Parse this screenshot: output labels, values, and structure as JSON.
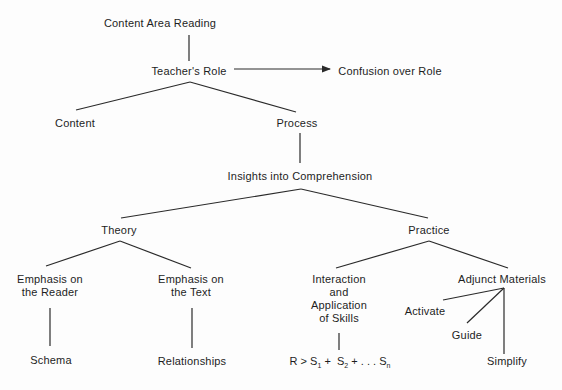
{
  "diagram": {
    "type": "tree",
    "nodes": {
      "root": "Content Area Reading",
      "teachers_role": "Teacher's Role",
      "confusion": "Confusion over Role",
      "content": "Content",
      "process": "Process",
      "insights": "Insights into Comprehension",
      "theory": "Theory",
      "practice": "Practice",
      "emph_reader_1": "Emphasis on",
      "emph_reader_2": "the Reader",
      "emph_text_1": "Emphasis on",
      "emph_text_2": "the Text",
      "interaction_1": "Interaction",
      "interaction_2": "and",
      "interaction_3": "Application",
      "interaction_4": "of Skills",
      "adjunct": "Adjunct Materials",
      "activate": "Activate",
      "guide": "Guide",
      "simplify": "Simplify",
      "schema": "Schema",
      "relationships": "Relationships"
    },
    "formula": {
      "r": "R",
      "gt": ">",
      "s": "S",
      "sub1": "1",
      "sub2": "2",
      "subn": "n",
      "plus": "+",
      "ellipsis": ". . ."
    },
    "edges": [
      [
        "Content Area Reading",
        "Teacher's Role"
      ],
      [
        "Teacher's Role",
        "Confusion over Role",
        "arrow"
      ],
      [
        "Teacher's Role",
        "Content"
      ],
      [
        "Teacher's Role",
        "Process"
      ],
      [
        "Process",
        "Insights into Comprehension"
      ],
      [
        "Insights into Comprehension",
        "Theory"
      ],
      [
        "Insights into Comprehension",
        "Practice"
      ],
      [
        "Theory",
        "Emphasis on the Reader"
      ],
      [
        "Theory",
        "Emphasis on the Text"
      ],
      [
        "Practice",
        "Interaction and Application of Skills"
      ],
      [
        "Practice",
        "Adjunct Materials"
      ],
      [
        "Emphasis on the Reader",
        "Schema"
      ],
      [
        "Emphasis on the Text",
        "Relationships"
      ],
      [
        "Interaction and Application of Skills",
        "R > S1 + S2 + . . . Sn"
      ],
      [
        "Adjunct Materials",
        "Activate"
      ],
      [
        "Adjunct Materials",
        "Guide"
      ],
      [
        "Adjunct Materials",
        "Simplify"
      ]
    ],
    "line_color": "#2a2a2a"
  }
}
